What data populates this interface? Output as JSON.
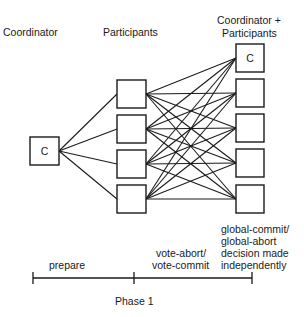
{
  "headers": {
    "coordinator": "Coordinator",
    "participants": "Participants",
    "coord_participants_line1": "Coordinator +",
    "coord_participants_line2": "Participants"
  },
  "nodes": {
    "coordinator": {
      "label": "C",
      "x": 30,
      "y": 137,
      "w": 29,
      "h": 28
    },
    "participants": [
      {
        "x": 117,
        "y": 80,
        "w": 29,
        "h": 28
      },
      {
        "x": 117,
        "y": 115,
        "w": 29,
        "h": 28
      },
      {
        "x": 117,
        "y": 150,
        "w": 29,
        "h": 28
      },
      {
        "x": 117,
        "y": 185,
        "w": 29,
        "h": 28
      }
    ],
    "right_column": [
      {
        "label": "C",
        "x": 236,
        "y": 44,
        "w": 28,
        "h": 28
      },
      {
        "label": "",
        "x": 236,
        "y": 79,
        "w": 28,
        "h": 28
      },
      {
        "label": "",
        "x": 236,
        "y": 114,
        "w": 28,
        "h": 28
      },
      {
        "label": "",
        "x": 236,
        "y": 149,
        "w": 28,
        "h": 28
      },
      {
        "label": "",
        "x": 236,
        "y": 185,
        "w": 28,
        "h": 28
      }
    ]
  },
  "edges": {
    "coordinator_to_participants": "all",
    "participants_to_right_column": "all (complete bipartite)"
  },
  "timeline": {
    "ticks_x": [
      33,
      134,
      252
    ],
    "y": 278,
    "segments": [
      {
        "label": "prepare"
      },
      {
        "label_line1": "vote-abort/",
        "label_line2": "vote-commit"
      }
    ],
    "end_label": [
      "global-commit/",
      "global-abort",
      "decision made",
      "independently"
    ],
    "phase_label": "Phase 1"
  }
}
